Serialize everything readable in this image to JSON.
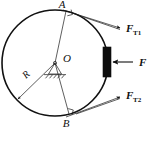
{
  "figure": {
    "type": "physics-free-body-diagram",
    "caption": ""
  },
  "labels": {
    "point_a": "A",
    "point_b": "B",
    "center_o": "O",
    "radius": "R",
    "force_t1_base": "F",
    "force_t1_sub": "T1",
    "force_t2_base": "F",
    "force_t2_sub": "T2",
    "force_pad": "F"
  },
  "geometry": {
    "circle_center_x": 55,
    "circle_center_y": 63,
    "circle_radius": 53,
    "point_a_x": 66,
    "point_a_y": 11,
    "point_b_x": 69,
    "point_b_y": 114,
    "pad_x": 103,
    "pad_y": 47,
    "pad_width": 8,
    "pad_height": 30
  },
  "colors": {
    "wheel_stroke": "#111111",
    "line_stroke": "#1a1a1a",
    "pad_fill": "#0d0d0d",
    "background": "#ffffff"
  },
  "annotations": {
    "right_angle_at_a": "right-angle-marker",
    "right_angle_at_b": "right-angle-marker",
    "support": "pinned-pivot-support-with-ground-hatching"
  }
}
